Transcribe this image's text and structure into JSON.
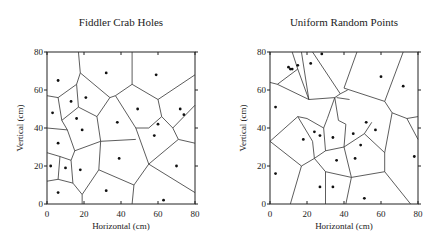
{
  "chart_data": [
    {
      "type": "scatter",
      "title": "Fiddler Crab Holes",
      "xlabel": "Horizontal (cm)",
      "ylabel": "Vertical (cm)",
      "xlim": [
        0,
        80
      ],
      "ylim": [
        0,
        80
      ],
      "xticks": [
        0,
        20,
        40,
        60,
        80
      ],
      "yticks": [
        0,
        20,
        40,
        60,
        80
      ],
      "grid": false,
      "overlay": "voronoi tessellation",
      "points": [
        [
          6,
          65
        ],
        [
          3,
          48
        ],
        [
          13,
          54
        ],
        [
          21,
          56
        ],
        [
          32,
          69
        ],
        [
          59,
          68
        ],
        [
          16,
          45
        ],
        [
          19,
          39
        ],
        [
          38,
          43
        ],
        [
          6,
          32
        ],
        [
          2,
          20
        ],
        [
          10,
          19
        ],
        [
          18,
          18
        ],
        [
          6,
          6
        ],
        [
          32,
          7
        ],
        [
          39,
          24
        ],
        [
          49,
          50
        ],
        [
          60,
          42
        ],
        [
          58,
          36
        ],
        [
          72,
          50
        ],
        [
          74,
          47
        ],
        [
          70,
          20
        ],
        [
          63,
          2
        ]
      ],
      "edges": [
        [
          [
            17,
            80
          ],
          [
            18,
            69
          ]
        ],
        [
          [
            18,
            69
          ],
          [
            16,
            63
          ]
        ],
        [
          [
            16,
            63
          ],
          [
            6,
            56
          ]
        ],
        [
          [
            6,
            56
          ],
          [
            0,
            57
          ]
        ],
        [
          [
            18,
            69
          ],
          [
            34,
            56
          ]
        ],
        [
          [
            16,
            63
          ],
          [
            17,
            51
          ]
        ],
        [
          [
            6,
            56
          ],
          [
            8,
            44
          ]
        ],
        [
          [
            8,
            44
          ],
          [
            17,
            51
          ]
        ],
        [
          [
            17,
            51
          ],
          [
            27,
            46
          ]
        ],
        [
          [
            34,
            56
          ],
          [
            37,
            57
          ]
        ],
        [
          [
            34,
            56
          ],
          [
            27,
            46
          ]
        ],
        [
          [
            46,
            80
          ],
          [
            46,
            63
          ]
        ],
        [
          [
            46,
            63
          ],
          [
            37,
            57
          ]
        ],
        [
          [
            46,
            63
          ],
          [
            60,
            55
          ]
        ],
        [
          [
            60,
            55
          ],
          [
            80,
            68
          ]
        ],
        [
          [
            37,
            57
          ],
          [
            48,
            40
          ]
        ],
        [
          [
            60,
            55
          ],
          [
            62,
            46
          ]
        ],
        [
          [
            62,
            46
          ],
          [
            55,
            40
          ]
        ],
        [
          [
            55,
            40
          ],
          [
            48,
            40
          ]
        ],
        [
          [
            62,
            46
          ],
          [
            68,
            40
          ]
        ],
        [
          [
            68,
            40
          ],
          [
            80,
            52
          ]
        ],
        [
          [
            68,
            40
          ],
          [
            71,
            34
          ]
        ],
        [
          [
            71,
            34
          ],
          [
            80,
            32
          ]
        ],
        [
          [
            71,
            34
          ],
          [
            55,
            21
          ]
        ],
        [
          [
            55,
            21
          ],
          [
            48,
            40
          ]
        ],
        [
          [
            27,
            46
          ],
          [
            29,
            33
          ]
        ],
        [
          [
            29,
            33
          ],
          [
            48,
            34
          ]
        ],
        [
          [
            8,
            44
          ],
          [
            11,
            39
          ]
        ],
        [
          [
            11,
            39
          ],
          [
            15,
            28
          ]
        ],
        [
          [
            15,
            28
          ],
          [
            29,
            33
          ]
        ],
        [
          [
            11,
            39
          ],
          [
            0,
            40
          ]
        ],
        [
          [
            15,
            28
          ],
          [
            13,
            23
          ]
        ],
        [
          [
            0,
            27
          ],
          [
            7,
            25
          ]
        ],
        [
          [
            7,
            25
          ],
          [
            13,
            23
          ]
        ],
        [
          [
            7,
            25
          ],
          [
            6,
            13
          ]
        ],
        [
          [
            6,
            13
          ],
          [
            0,
            12
          ]
        ],
        [
          [
            6,
            13
          ],
          [
            14,
            11
          ]
        ],
        [
          [
            13,
            23
          ],
          [
            14,
            11
          ]
        ],
        [
          [
            14,
            11
          ],
          [
            19,
            5
          ]
        ],
        [
          [
            19,
            5
          ],
          [
            19,
            0
          ]
        ],
        [
          [
            29,
            33
          ],
          [
            28,
            18
          ]
        ],
        [
          [
            28,
            18
          ],
          [
            19,
            5
          ]
        ],
        [
          [
            28,
            18
          ],
          [
            47,
            10
          ]
        ],
        [
          [
            47,
            10
          ],
          [
            55,
            21
          ]
        ],
        [
          [
            47,
            10
          ],
          [
            46,
            0
          ]
        ],
        [
          [
            55,
            21
          ],
          [
            80,
            6
          ]
        ]
      ]
    },
    {
      "type": "scatter",
      "title": "Uniform Random Points",
      "xlabel": "Horizontal (cm)",
      "ylabel": "Vertical (cm)",
      "xlim": [
        0,
        80
      ],
      "ylim": [
        0,
        80
      ],
      "xticks": [
        0,
        20,
        40,
        60,
        80
      ],
      "yticks": [
        0,
        20,
        40,
        60,
        80
      ],
      "grid": false,
      "overlay": "voronoi tessellation",
      "points": [
        [
          10,
          72
        ],
        [
          11,
          71
        ],
        [
          12,
          71
        ],
        [
          15,
          73
        ],
        [
          22,
          74
        ],
        [
          28,
          79
        ],
        [
          3,
          51
        ],
        [
          60,
          67
        ],
        [
          72,
          62
        ],
        [
          52,
          43
        ],
        [
          57,
          39
        ],
        [
          18,
          34
        ],
        [
          24,
          38
        ],
        [
          27,
          36
        ],
        [
          34,
          35
        ],
        [
          45,
          37
        ],
        [
          49,
          31
        ],
        [
          36,
          23
        ],
        [
          46,
          24
        ],
        [
          78,
          25
        ],
        [
          3,
          16
        ],
        [
          27,
          9
        ],
        [
          34,
          9
        ],
        [
          51,
          3
        ]
      ],
      "edges": [
        [
          [
            12,
            80
          ],
          [
            15,
            71
          ]
        ],
        [
          [
            15,
            71
          ],
          [
            4,
            63
          ]
        ],
        [
          [
            4,
            63
          ],
          [
            0,
            64
          ]
        ],
        [
          [
            17,
            80
          ],
          [
            21,
            55
          ]
        ],
        [
          [
            15,
            71
          ],
          [
            21,
            55
          ]
        ],
        [
          [
            4,
            63
          ],
          [
            21,
            55
          ]
        ],
        [
          [
            23,
            80
          ],
          [
            38,
            58
          ]
        ],
        [
          [
            21,
            55
          ],
          [
            35,
            56
          ]
        ],
        [
          [
            35,
            56
          ],
          [
            38,
            58
          ]
        ],
        [
          [
            38,
            58
          ],
          [
            42,
            60
          ]
        ],
        [
          [
            47,
            80
          ],
          [
            40,
            61
          ]
        ],
        [
          [
            40,
            61
          ],
          [
            62,
            54
          ]
        ],
        [
          [
            62,
            54
          ],
          [
            72,
            80
          ]
        ],
        [
          [
            62,
            54
          ],
          [
            66,
            48
          ]
        ],
        [
          [
            66,
            48
          ],
          [
            74,
            45
          ]
        ],
        [
          [
            74,
            45
          ],
          [
            80,
            46
          ]
        ],
        [
          [
            66,
            48
          ],
          [
            62,
            27
          ]
        ],
        [
          [
            74,
            45
          ],
          [
            80,
            34
          ]
        ],
        [
          [
            35,
            56
          ],
          [
            31,
            45
          ]
        ],
        [
          [
            31,
            45
          ],
          [
            29,
            40
          ]
        ],
        [
          [
            35,
            56
          ],
          [
            37,
            44
          ]
        ],
        [
          [
            37,
            44
          ],
          [
            41,
            42
          ]
        ],
        [
          [
            41,
            42
          ],
          [
            40,
            30
          ]
        ],
        [
          [
            36,
            56
          ],
          [
            43,
            55
          ]
        ],
        [
          [
            29,
            40
          ],
          [
            20,
            45
          ]
        ],
        [
          [
            20,
            45
          ],
          [
            15,
            46
          ]
        ],
        [
          [
            15,
            46
          ],
          [
            0,
            33
          ]
        ],
        [
          [
            15,
            46
          ],
          [
            23,
            33
          ]
        ],
        [
          [
            23,
            33
          ],
          [
            24,
            24
          ]
        ],
        [
          [
            0,
            33
          ],
          [
            17,
            20
          ]
        ],
        [
          [
            17,
            20
          ],
          [
            24,
            24
          ]
        ],
        [
          [
            29,
            40
          ],
          [
            30,
            28
          ]
        ],
        [
          [
            30,
            28
          ],
          [
            24,
            24
          ]
        ],
        [
          [
            30,
            28
          ],
          [
            40,
            30
          ]
        ],
        [
          [
            40,
            30
          ],
          [
            51,
            37
          ]
        ],
        [
          [
            51,
            37
          ],
          [
            62,
            27
          ]
        ],
        [
          [
            40,
            30
          ],
          [
            44,
            14
          ]
        ],
        [
          [
            44,
            14
          ],
          [
            62,
            17
          ]
        ],
        [
          [
            62,
            17
          ],
          [
            62,
            27
          ]
        ],
        [
          [
            62,
            17
          ],
          [
            76,
            0
          ]
        ],
        [
          [
            24,
            24
          ],
          [
            30,
            17
          ]
        ],
        [
          [
            30,
            17
          ],
          [
            44,
            14
          ]
        ],
        [
          [
            30,
            17
          ],
          [
            30,
            0
          ]
        ],
        [
          [
            17,
            20
          ],
          [
            11,
            0
          ]
        ],
        [
          [
            44,
            14
          ],
          [
            41,
            0
          ]
        ],
        [
          [
            51,
            37
          ],
          [
            55,
            43
          ]
        ]
      ]
    }
  ]
}
